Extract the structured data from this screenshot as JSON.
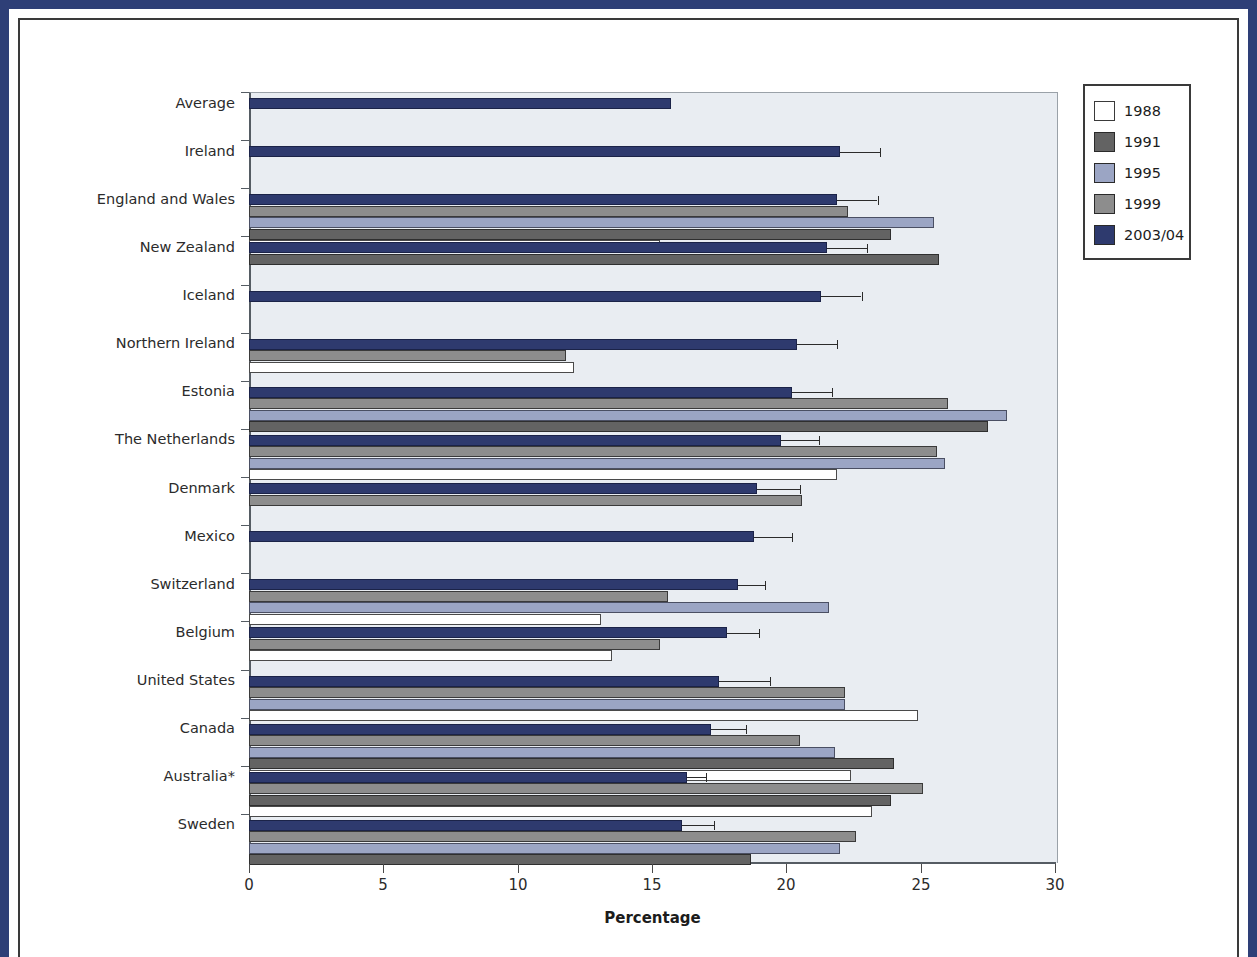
{
  "chart_data": {
    "type": "bar",
    "orientation": "horizontal",
    "title": "",
    "xlabel": "Percentage",
    "ylabel": "",
    "xlim": [
      0,
      30
    ],
    "xticks": [
      0,
      5,
      10,
      15,
      20,
      25,
      30
    ],
    "grid": false,
    "legend_position": "top-right",
    "legend": [
      "1988",
      "1991",
      "1995",
      "1999",
      "2003/04"
    ],
    "series_colors": {
      "1988": "#ffffff",
      "1991": "#636363",
      "1995": "#9ba5c4",
      "1999": "#8d8d8d",
      "2003/04": "#2e3a6e"
    },
    "categories": [
      "Average",
      "Ireland",
      "England and Wales",
      "New Zealand",
      "Iceland",
      "Northern Ireland",
      "Estonia",
      "The Netherlands",
      "Denmark",
      "Mexico",
      "Switzerland",
      "Belgium",
      "United States",
      "Canada",
      "Australia*",
      "Sweden"
    ],
    "series": [
      {
        "name": "1988",
        "values": [
          null,
          null,
          15.3,
          null,
          null,
          12.1,
          null,
          21.9,
          null,
          null,
          13.1,
          13.5,
          24.9,
          22.4,
          23.2,
          null
        ]
      },
      {
        "name": "1991",
        "values": [
          null,
          null,
          23.9,
          25.7,
          null,
          null,
          27.5,
          null,
          null,
          null,
          null,
          null,
          null,
          24.0,
          23.9,
          18.7
        ]
      },
      {
        "name": "1995",
        "values": [
          null,
          null,
          25.5,
          null,
          null,
          null,
          28.2,
          25.9,
          null,
          null,
          21.6,
          null,
          22.2,
          21.8,
          null,
          22.0
        ]
      },
      {
        "name": "1999",
        "values": [
          null,
          null,
          22.3,
          null,
          null,
          11.8,
          26.0,
          25.6,
          20.6,
          null,
          15.6,
          15.3,
          22.2,
          20.5,
          25.1,
          22.6
        ]
      },
      {
        "name": "2003/04",
        "values": [
          15.7,
          22.0,
          21.9,
          21.5,
          21.3,
          20.4,
          20.2,
          19.8,
          18.9,
          18.8,
          18.2,
          17.8,
          17.5,
          17.2,
          16.3,
          16.1
        ]
      }
    ],
    "error_bars_2003": [
      {
        "category": "Average",
        "upper": null
      },
      {
        "category": "Ireland",
        "upper": 23.5
      },
      {
        "category": "England and Wales",
        "upper": 23.4
      },
      {
        "category": "New Zealand",
        "upper": 23.0
      },
      {
        "category": "Iceland",
        "upper": 22.8
      },
      {
        "category": "Northern Ireland",
        "upper": 21.9
      },
      {
        "category": "Estonia",
        "upper": 21.7
      },
      {
        "category": "The Netherlands",
        "upper": 21.2
      },
      {
        "category": "Denmark",
        "upper": 20.5
      },
      {
        "category": "Mexico",
        "upper": 20.2
      },
      {
        "category": "Switzerland",
        "upper": 19.2
      },
      {
        "category": "Belgium",
        "upper": 19.0
      },
      {
        "category": "United States",
        "upper": 19.4
      },
      {
        "category": "Canada",
        "upper": 18.5
      },
      {
        "category": "Australia*",
        "upper": 17.0
      },
      {
        "category": "Sweden",
        "upper": 17.3
      }
    ]
  }
}
